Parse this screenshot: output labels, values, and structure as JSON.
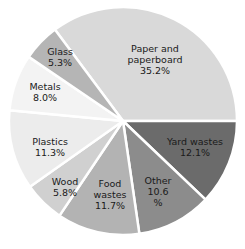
{
  "chart_data": {
    "type": "pie",
    "title": "",
    "start_angle_deg": -36.7,
    "direction": "clockwise",
    "slices": [
      {
        "label": "Paper and paperboard",
        "lines": [
          "Paper and",
          "paperboard",
          "35.2%"
        ],
        "value": 35.2,
        "color": "#d9d9d9",
        "label_pos": [
          155,
          60
        ]
      },
      {
        "label": "Yard wastes",
        "lines": [
          "Yard wastes",
          "12.1%"
        ],
        "value": 12.1,
        "color": "#6b6b6b",
        "label_pos": [
          195,
          147
        ]
      },
      {
        "label": "Other",
        "lines": [
          "Other",
          "10.6",
          "%"
        ],
        "value": 10.6,
        "color": "#8c8c8c",
        "label_pos": [
          158,
          192
        ]
      },
      {
        "label": "Food wastes",
        "lines": [
          "Food",
          "wastes",
          "11.7%"
        ],
        "value": 11.7,
        "color": "#b3b3b3",
        "label_pos": [
          110,
          195
        ]
      },
      {
        "label": "Wood",
        "lines": [
          "Wood",
          "5.8%"
        ],
        "value": 5.8,
        "color": "#d0d0d0",
        "label_pos": [
          65,
          187
        ]
      },
      {
        "label": "Plastics",
        "lines": [
          "Plastics",
          "11.3%"
        ],
        "value": 11.3,
        "color": "#ececec",
        "label_pos": [
          50,
          147
        ]
      },
      {
        "label": "Metals",
        "lines": [
          "Metals",
          "8.0%"
        ],
        "value": 8.0,
        "color": "#f3f3f3",
        "label_pos": [
          45,
          92
        ]
      },
      {
        "label": "Glass",
        "lines": [
          "Glass",
          "5.3%"
        ],
        "value": 5.3,
        "color": "#b5b5b5",
        "label_pos": [
          60,
          57
        ]
      }
    ],
    "center": [
      123,
      121
    ],
    "radius": 114,
    "separator_color": "#ffffff",
    "legend": "none"
  }
}
